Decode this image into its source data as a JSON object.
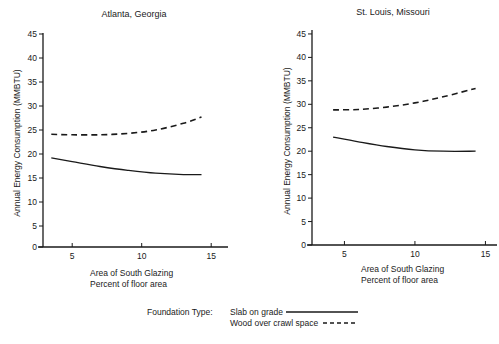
{
  "legend": {
    "title": "Foundation Type:",
    "entries": [
      {
        "label": "Slab on grade",
        "style": "solid"
      },
      {
        "label": "Wood over crawl space",
        "style": "dashed"
      }
    ]
  },
  "chart_data": [
    {
      "type": "line",
      "title": "Atlanta, Georgia",
      "xlabel": "Area of South Glazing",
      "xlabel2": "Percent of floor area",
      "ylabel": "Annual Energy Consumption (MMBTU)",
      "xticks": [
        5,
        10,
        15
      ],
      "yticks": [
        0,
        5,
        10,
        15,
        20,
        25,
        30,
        35,
        40,
        45
      ],
      "xlim": [
        2.9,
        16
      ],
      "ylim": [
        0,
        46
      ],
      "grid": false,
      "series": [
        {
          "name": "Slab on grade",
          "style": "solid",
          "x": [
            3.5,
            5,
            7,
            9,
            11,
            13,
            14.3
          ],
          "y": [
            19.2,
            18.4,
            17.4,
            16.6,
            16.0,
            15.7,
            15.7
          ]
        },
        {
          "name": "Wood over crawl space",
          "style": "dashed",
          "x": [
            3.5,
            5,
            7,
            9,
            11,
            13,
            14.3
          ],
          "y": [
            24.1,
            24.0,
            24.0,
            24.3,
            25.0,
            26.4,
            27.7
          ]
        }
      ]
    },
    {
      "type": "line",
      "title": "St. Louis, Missouri",
      "xlabel": "Area of South Glazing",
      "xlabel2": "Percent of floor area",
      "ylabel": "Annual Energy Consumption (MMBTU)",
      "xticks": [
        5,
        10,
        15
      ],
      "yticks": [
        0,
        5,
        10,
        15,
        20,
        25,
        30,
        35,
        40,
        45
      ],
      "xlim": [
        2.7,
        16.5
      ],
      "ylim": [
        0,
        46
      ],
      "grid": false,
      "series": [
        {
          "name": "Slab on grade",
          "style": "solid",
          "x": [
            4.2,
            6,
            8,
            10,
            12,
            14.3
          ],
          "y": [
            23.0,
            22.0,
            21.0,
            20.3,
            20.0,
            20.0
          ]
        },
        {
          "name": "Wood over crawl space",
          "style": "dashed",
          "x": [
            4.2,
            6,
            8,
            10,
            12,
            14.3
          ],
          "y": [
            28.8,
            28.9,
            29.4,
            30.3,
            31.6,
            33.4
          ]
        }
      ]
    }
  ]
}
